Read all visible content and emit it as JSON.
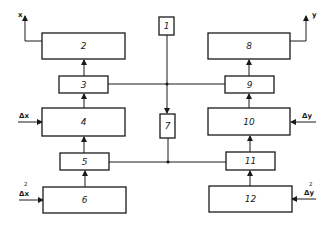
{
  "diagram": {
    "type": "block-diagram",
    "blocks": [
      {
        "id": "1",
        "label": "1"
      },
      {
        "id": "2",
        "label": "2"
      },
      {
        "id": "3",
        "label": "3"
      },
      {
        "id": "4",
        "label": "4"
      },
      {
        "id": "5",
        "label": "5"
      },
      {
        "id": "6",
        "label": "6"
      },
      {
        "id": "7",
        "label": "7"
      },
      {
        "id": "8",
        "label": "8"
      },
      {
        "id": "9",
        "label": "9"
      },
      {
        "id": "10",
        "label": "10"
      },
      {
        "id": "11",
        "label": "11"
      },
      {
        "id": "12",
        "label": "12"
      }
    ],
    "outputs": {
      "left": "x",
      "right": "y"
    },
    "inputs": {
      "block4": "Δx",
      "block6_base": "Δx",
      "block6_sup": "2",
      "block10": "Δy",
      "block12_base": "Δy",
      "block12_sup": "2"
    },
    "connections": [
      {
        "from": "6",
        "to": "5"
      },
      {
        "from": "5",
        "to": "4"
      },
      {
        "from": "4",
        "to": "3"
      },
      {
        "from": "3",
        "to": "2"
      },
      {
        "from": "12",
        "to": "11"
      },
      {
        "from": "11",
        "to": "10"
      },
      {
        "from": "10",
        "to": "9"
      },
      {
        "from": "9",
        "to": "8"
      },
      {
        "from": "1",
        "to": "7"
      },
      {
        "from": "3",
        "to": "9",
        "type": "line"
      },
      {
        "from": "5",
        "to": "11",
        "type": "line"
      },
      {
        "from": "2",
        "to": "x"
      },
      {
        "from": "8",
        "to": "y"
      }
    ]
  }
}
